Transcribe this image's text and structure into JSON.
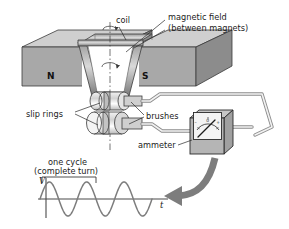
{
  "figure": {
    "background": "#ffffff",
    "width": 289,
    "height": 229
  },
  "labels": {
    "coil": "coil",
    "magnetic_field_line1": "magnetic field",
    "magnetic_field_line2": "(between magnets)",
    "north_pole": "N",
    "south_pole": "S",
    "slip_rings": "slip rings",
    "brushes": "brushes",
    "ammeter": "ammeter",
    "one_cycle_line1": "one cycle",
    "one_cycle_line2": "(complete turn)",
    "axis_v": "V",
    "axis_t": "t"
  },
  "colors": {
    "outline": "#2a2a2a",
    "magnet_top": "#c9c9c9",
    "magnet_front": "#a9a9a9",
    "magnet_side": "#8f8f8f",
    "coil_wire": "#6f6f6f",
    "wire": "#d8d8d8",
    "ammeter_face": "#efefef",
    "ammeter_body": "#b5b5b5",
    "arrow": "#6e6e6e",
    "wave": "#7a7a7a",
    "text": "#1b1b1b"
  },
  "chart_data": {
    "type": "line",
    "title": "one cycle (complete turn)",
    "xlabel": "t",
    "ylabel": "V",
    "grid": false,
    "legend": null,
    "waveform": "sine",
    "cycles": 3,
    "amplitude": 1,
    "annotation": {
      "text": "one cycle (complete turn)",
      "spans_cycles": 1,
      "bracket_from_x": 0.0,
      "bracket_to_x": 1.0
    },
    "x": [
      0,
      0.125,
      0.25,
      0.375,
      0.5,
      0.625,
      0.75,
      0.875,
      1,
      1.125,
      1.25,
      1.375,
      1.5,
      1.625,
      1.75,
      1.875,
      2,
      2.125,
      2.25,
      2.375,
      2.5,
      2.625,
      2.75,
      2.875,
      3
    ],
    "y": [
      0,
      0.707,
      1,
      0.707,
      0,
      -0.707,
      -1,
      -0.707,
      0,
      0.707,
      1,
      0.707,
      0,
      -0.707,
      -1,
      -0.707,
      0,
      0.707,
      1,
      0.707,
      0,
      -0.707,
      -1,
      -0.707,
      0
    ],
    "xlim": [
      0,
      3.35
    ],
    "ylim": [
      -1.25,
      1.25
    ]
  },
  "ammeter": {
    "scale_minus": "–",
    "scale_zero": "0",
    "scale_plus": "+",
    "needle_deflection_deg": -28
  },
  "rotation_arrows": {
    "top_axis_arrow": "rotation-curl-top",
    "mid_axis_arrow": "rotation-curl-middle"
  }
}
